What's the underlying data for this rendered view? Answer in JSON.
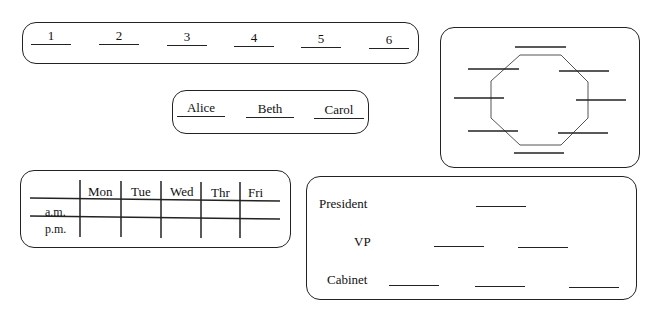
{
  "numbers_box": {
    "slots": [
      "1",
      "2",
      "3",
      "4",
      "5",
      "6"
    ]
  },
  "names_box": {
    "slots": [
      "Alice",
      "Beth",
      "Carol"
    ]
  },
  "table_box": {
    "columns": [
      "Mon",
      "Tue",
      "Wed",
      "Thr",
      "Fri"
    ],
    "rows": [
      "a.m.",
      "p.m."
    ]
  },
  "octagon_box": {
    "seat_count": 8
  },
  "hierarchy_box": {
    "levels": [
      {
        "label": "President",
        "blanks": 1
      },
      {
        "label": "VP",
        "blanks": 2
      },
      {
        "label": "Cabinet",
        "blanks": 3
      }
    ]
  }
}
